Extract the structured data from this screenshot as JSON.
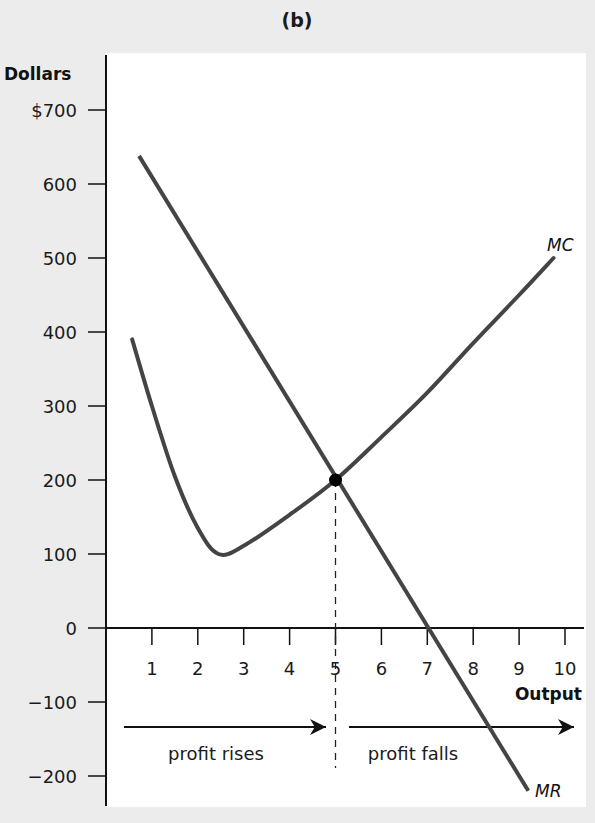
{
  "chart_data": {
    "type": "line",
    "title": "(b)",
    "xlabel": "Output",
    "ylabel": "Dollars",
    "xlim": [
      0,
      10.4
    ],
    "ylim": [
      -240,
      740
    ],
    "x_ticks": [
      1,
      2,
      3,
      4,
      5,
      6,
      7,
      8,
      9,
      10
    ],
    "x_tick_labels": [
      "1",
      "2",
      "3",
      "4",
      "5",
      "6",
      "7",
      "8",
      "9",
      "10"
    ],
    "y_ticks": [
      700,
      600,
      500,
      400,
      300,
      200,
      100,
      0,
      -100,
      -200
    ],
    "y_tick_labels": [
      "$700",
      "600",
      "500",
      "400",
      "300",
      "200",
      "100",
      "0",
      "−100",
      "−200"
    ],
    "grid": false,
    "series": [
      {
        "name": "MC",
        "label": "MC",
        "color": "#444444",
        "points": [
          [
            0.57,
            390
          ],
          [
            1.0,
            300
          ],
          [
            1.5,
            205
          ],
          [
            2.0,
            135
          ],
          [
            2.45,
            100
          ],
          [
            3.0,
            111
          ],
          [
            4.0,
            153
          ],
          [
            5.0,
            200
          ],
          [
            6.0,
            258
          ],
          [
            7.0,
            318
          ],
          [
            8.0,
            385
          ],
          [
            9.0,
            450
          ],
          [
            9.75,
            500
          ]
        ]
      },
      {
        "name": "MR",
        "label": "MR",
        "color": "#444444",
        "points": [
          [
            0.72,
            638
          ],
          [
            9.2,
            -220
          ]
        ]
      }
    ],
    "highlight_point": {
      "x": 5,
      "y": 200,
      "label": "MC = MR"
    },
    "reference_line": {
      "x": 5,
      "style": "dashed"
    },
    "annotations": [
      {
        "text": "profit rises",
        "direction": "right",
        "x_from": 0.4,
        "x_to": 4.8,
        "y": -135
      },
      {
        "text": "profit falls",
        "direction": "right",
        "x_from": 5.3,
        "x_to": 10.2,
        "y": -135
      }
    ]
  },
  "colors": {
    "curve": "#444444",
    "axis": "#111111",
    "plot_bg": "#ffffff",
    "page_bg": "#ececec"
  }
}
